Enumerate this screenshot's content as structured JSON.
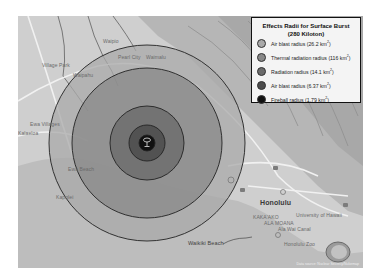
{
  "map": {
    "type": "nuclear blast effects map",
    "legend": {
      "title_line1": "Effects Radii for Surface Burst",
      "title_line2": "(280 Kiloton)",
      "items": [
        {
          "label": "Air blast radius (26.2 km",
          "unit_sup": "2",
          "close": ")",
          "color": "#a9a9a9",
          "radius_px": 98
        },
        {
          "label": "Thermal radiation radius (116 km",
          "unit_sup": "2",
          "close": ")",
          "color": "#888888",
          "radius_px": 75
        },
        {
          "label": "Radiation radius (14.1 km",
          "unit_sup": "2",
          "close": ")",
          "color": "#6b6b6b",
          "radius_px": 37
        },
        {
          "label": "Air blast radius (6.37 km",
          "unit_sup": "2",
          "close": ")",
          "color": "#4c4c4c",
          "radius_px": 18
        },
        {
          "label": "Fireball radius (1.79 km",
          "unit_sup": "2",
          "close": ")",
          "color": "#111111",
          "radius_px": 8
        }
      ]
    },
    "place_labels": [
      {
        "text": "Waipio",
        "x": 85,
        "y": 24
      },
      {
        "text": "Village Park",
        "x": 24,
        "y": 48
      },
      {
        "text": "Waipahu",
        "x": 55,
        "y": 58
      },
      {
        "text": "Pearl City",
        "x": 113,
        "y": 40
      },
      {
        "text": "Waimalu",
        "x": 148,
        "y": 40
      },
      {
        "text": "Ewa Villages",
        "x": 12,
        "y": 107
      },
      {
        "text": "Kalaeloa",
        "x": 0,
        "y": 116
      },
      {
        "text": "Kapolei",
        "x": 8,
        "y": 180
      },
      {
        "text": "Ewa Beach",
        "x": 50,
        "y": 150
      },
      {
        "text": "Honolulu",
        "x": 242,
        "y": 188,
        "kind": "city"
      },
      {
        "text": "KAKA'AKO",
        "x": 235,
        "y": 202
      },
      {
        "text": "ALA MOANA",
        "x": 246,
        "y": 207
      },
      {
        "text": "University of Hawaii",
        "x": 272,
        "y": 200
      },
      {
        "text": "Ala Wai Canal",
        "x": 260,
        "y": 213
      },
      {
        "text": "Honolulu Zoo",
        "x": 280,
        "y": 228
      },
      {
        "text": "Waikiki Beach",
        "x": 200,
        "y": 230,
        "kind": "beach"
      }
    ],
    "center": {
      "x": 129,
      "y": 127
    },
    "attribution": "Data source: Nuclear Secrecy/Nukemap"
  }
}
